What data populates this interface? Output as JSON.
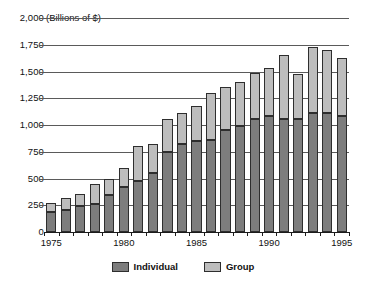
{
  "chart_data": {
    "type": "bar",
    "subtype": "stacked-bar",
    "title": "",
    "subtitle": "",
    "units_label": "(Billions of $)",
    "xlabel": "",
    "ylabel": "",
    "ylim": [
      0,
      2000
    ],
    "yticks": [
      0,
      250,
      500,
      750,
      1000,
      1250,
      1500,
      1750,
      2000
    ],
    "ytick_labels": [
      "0",
      "250",
      "500",
      "750",
      "1,000",
      "1,250",
      "1,500",
      "1,750",
      "2,000"
    ],
    "grid": true,
    "grid_axis": "y",
    "legend_position": "bottom-center",
    "categories": [
      "1975",
      "1976",
      "1977",
      "1978",
      "1979",
      "1980",
      "1981",
      "1982",
      "1983",
      "1984",
      "1985",
      "1986",
      "1987",
      "1988",
      "1989",
      "1990",
      "1991",
      "1992",
      "1993",
      "1994",
      "1995"
    ],
    "xtick_labels": [
      "1975",
      "1980",
      "1985",
      "1990",
      "1995"
    ],
    "xtick_categories": [
      "1975",
      "1980",
      "1985",
      "1990",
      "1995"
    ],
    "series": [
      {
        "name": "Individual",
        "color": "#7d7d7d",
        "values": [
          185,
          210,
          245,
          265,
          345,
          425,
          480,
          555,
          750,
          825,
          850,
          860,
          955,
          995,
          1060,
          1085,
          1060,
          1060,
          1110,
          1110,
          1085
        ]
      },
      {
        "name": "Group",
        "color": "#bdbdbd",
        "values": [
          85,
          105,
          115,
          180,
          150,
          175,
          320,
          265,
          305,
          285,
          330,
          440,
          400,
          405,
          430,
          450,
          590,
          420,
          615,
          595,
          545
        ]
      }
    ],
    "totals": [
      270,
      315,
      360,
      445,
      495,
      600,
      800,
      820,
      1055,
      1110,
      1180,
      1300,
      1355,
      1400,
      1490,
      1535,
      1650,
      1480,
      1725,
      1705,
      1630
    ]
  },
  "legend": {
    "items": [
      {
        "label": "Individual",
        "color": "#7d7d7d"
      },
      {
        "label": "Group",
        "color": "#bdbdbd"
      }
    ]
  },
  "colors": {
    "individual": "#7d7d7d",
    "group": "#bdbdbd",
    "gridline": "#5a5a5a",
    "axis": "#1b1b1b",
    "background": "#ffffff",
    "text": "#111111"
  }
}
